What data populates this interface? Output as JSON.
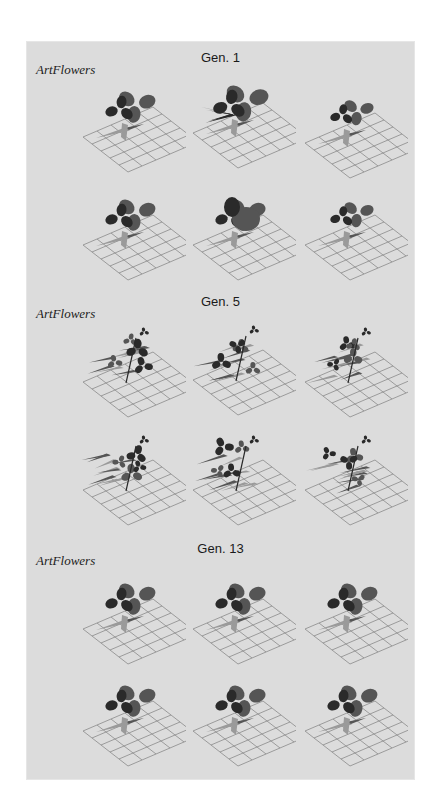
{
  "figure": {
    "sections": [
      {
        "title": "Gen. 1",
        "brand": "ArtFlowers",
        "specimens": [
          {
            "label": "Gen. 1 specimen 1",
            "style": "broad"
          },
          {
            "label": "Gen. 1 specimen 2",
            "style": "broad-dense"
          },
          {
            "label": "Gen. 1 specimen 3",
            "style": "broad-small"
          },
          {
            "label": "Gen. 1 specimen 4",
            "style": "broad"
          },
          {
            "label": "Gen. 1 specimen 5",
            "style": "broad-petal"
          },
          {
            "label": "Gen. 1 specimen 6",
            "style": "broad"
          }
        ]
      },
      {
        "title": "Gen. 5",
        "brand": "ArtFlowers",
        "specimens": [
          {
            "label": "Gen. 5 specimen 1",
            "style": "branching"
          },
          {
            "label": "Gen. 5 specimen 2",
            "style": "branching-tall"
          },
          {
            "label": "Gen. 5 specimen 3",
            "style": "branching"
          },
          {
            "label": "Gen. 5 specimen 4",
            "style": "branching"
          },
          {
            "label": "Gen. 5 specimen 5",
            "style": "branching"
          },
          {
            "label": "Gen. 5 specimen 6",
            "style": "branching-wide"
          }
        ]
      },
      {
        "title": "Gen. 13",
        "brand": "ArtFlowers",
        "specimens": [
          {
            "label": "Gen. 13 specimen 1",
            "style": "multi-bloom"
          },
          {
            "label": "Gen. 13 specimen 2",
            "style": "multi-bloom"
          },
          {
            "label": "Gen. 13 specimen 3",
            "style": "multi-bloom"
          },
          {
            "label": "Gen. 13 specimen 4",
            "style": "multi-bloom-low"
          },
          {
            "label": "Gen. 13 specimen 5",
            "style": "multi-bloom"
          },
          {
            "label": "Gen. 13 specimen 6",
            "style": "multi-bloom"
          }
        ]
      }
    ],
    "colors": {
      "panel_bg": "#dcdcdc",
      "grid": "#8a8a8a",
      "petal_dark": "#2a2a2a",
      "petal_mid": "#555555",
      "leaf_light": "#9a9a9a"
    }
  }
}
